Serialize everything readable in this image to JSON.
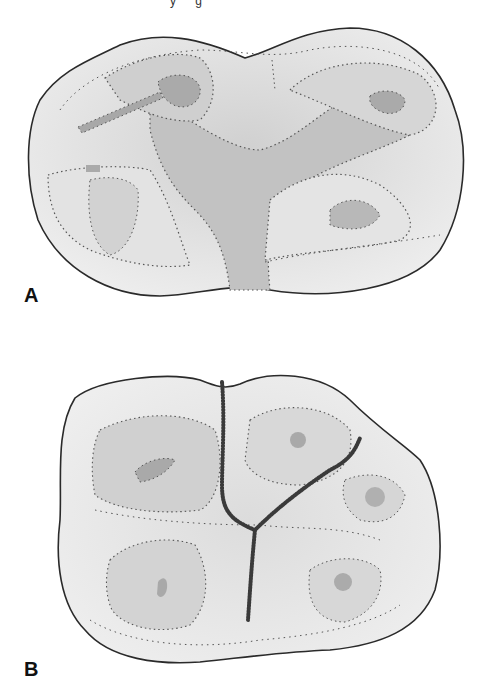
{
  "caption_fragment": "y g",
  "figures": [
    {
      "label": "A",
      "description": "Occlusal view of tooth with cusps, ridges and fossae (shaded regions with dotted outlines)"
    },
    {
      "label": "B",
      "description": "Occlusal view of tooth with Y-shaped central groove and cusps outlined by dotted lines"
    }
  ],
  "colors": {
    "outline": "#2a2a2a",
    "enamel_light": "#ececec",
    "enamel_mid": "#d4d4d4",
    "fossa_dark": "#b5b5b5",
    "dots": "#555555",
    "groove": "#3a3a3a"
  }
}
